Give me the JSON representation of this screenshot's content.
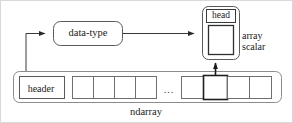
{
  "figure": {
    "background": "#ffffff",
    "border_color": "#d9d9d9",
    "width": 293,
    "height": 123
  },
  "nodes": {
    "data_type": {
      "label": "data-type",
      "shape": "rounded-rect",
      "x": 52,
      "y": 20,
      "w": 70,
      "h": 25,
      "stroke": "#555555"
    },
    "array_scalar_container": {
      "shape": "rounded-rect",
      "x": 201,
      "y": 5,
      "w": 38,
      "h": 54,
      "stroke": "#555555"
    },
    "head": {
      "label": "head",
      "shape": "rect",
      "x": 205,
      "y": 8,
      "w": 30,
      "h": 13,
      "stroke": "#3a3a3a"
    },
    "scalar_value_box": {
      "shape": "rect",
      "x": 207,
      "y": 24,
      "w": 26,
      "h": 30,
      "stroke": "#333333"
    },
    "array_scalar_caption": {
      "line1": "array",
      "line2": "scalar"
    },
    "ndarray_container": {
      "label": "ndarray",
      "shape": "rounded-rect",
      "x": 12,
      "y": 70,
      "w": 269,
      "h": 32,
      "stroke": "#777777"
    },
    "header": {
      "label": "header",
      "shape": "rect",
      "x": 18,
      "y": 75,
      "w": 45,
      "h": 23,
      "stroke": "#555555"
    },
    "ellipsis": {
      "label": "..."
    }
  },
  "cells": {
    "left_group": {
      "x": 71,
      "y": 75,
      "cell_w": 21,
      "cell_h": 23,
      "count": 4,
      "items": [
        {
          "highlighted": false
        },
        {
          "highlighted": false
        },
        {
          "highlighted": false
        },
        {
          "highlighted": false
        }
      ]
    },
    "right_group": {
      "x": 180,
      "y": 75,
      "cell_w": 23,
      "cell_h": 23,
      "count": 4,
      "items": [
        {
          "highlighted": false
        },
        {
          "highlighted": true
        },
        {
          "highlighted": false
        },
        {
          "highlighted": false
        }
      ]
    },
    "highlight_stroke": "#1a1a1a",
    "normal_stroke": "#6a6a6a"
  },
  "connectors": [
    {
      "name": "header-to-data-type",
      "from": "header",
      "to": "data_type",
      "path": "M25,70 L25,32 L46,32",
      "arrow_at": {
        "x": 50,
        "y": 32,
        "dir": "right"
      },
      "stroke": "#3a3a3a"
    },
    {
      "name": "data-type-to-array-scalar",
      "from": "data_type",
      "to": "array_scalar_container",
      "path": "M122,33 L194,33",
      "arrow_at": {
        "x": 199,
        "y": 33,
        "dir": "right"
      },
      "stroke": "#3a3a3a"
    },
    {
      "name": "highlighted-cell-to-array-scalar",
      "from": "highlighted_cell",
      "to": "scalar_value_box",
      "path": "M214,75 L214,62",
      "arrow_at": {
        "x": 214,
        "y": 56,
        "dir": "up"
      },
      "stroke": "#1a1a1a"
    }
  ],
  "colors": {
    "ink": "#1a1a1a",
    "line": "#555555",
    "faint_line": "#8a8a8a",
    "paper": "#ffffff"
  }
}
